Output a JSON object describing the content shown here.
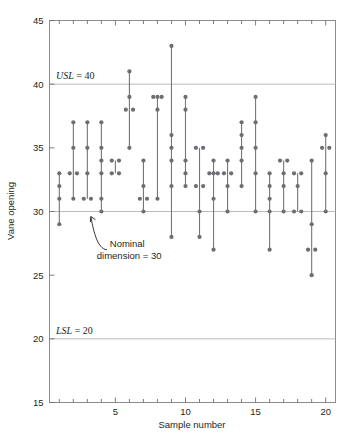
{
  "chart_data": {
    "type": "scatter",
    "title": "",
    "xlabel": "Sample number",
    "ylabel": "Vane opening",
    "xlim": [
      0.3,
      20.7
    ],
    "ylim": [
      15,
      45
    ],
    "ytick_labels": [
      "15",
      "20",
      "25",
      "30",
      "35",
      "40",
      "45"
    ],
    "ytick_values": [
      15,
      20,
      25,
      30,
      35,
      40,
      45
    ],
    "xtick_labels": [
      "5",
      "10",
      "15",
      "20"
    ],
    "xtick_values": [
      5,
      10,
      15,
      20
    ],
    "xminor_values": [
      1,
      2,
      3,
      4,
      6,
      7,
      8,
      9,
      11,
      12,
      13,
      14,
      16,
      17,
      18,
      19
    ],
    "grid": "horizontal-at-spec-and-nominal-only",
    "legend": "none",
    "reference_lines": [
      {
        "name": "USL",
        "label": "USL = 40",
        "value": 40,
        "label_x": 2.0,
        "label_y": 40.8
      },
      {
        "name": "Nominal",
        "label": "Nominal dimension = 30",
        "value": 30
      },
      {
        "name": "LSL",
        "label": "LSL = 20",
        "value": 20,
        "label_x": 2.0,
        "label_y": 20.8
      }
    ],
    "annotation": {
      "text_line1": "Nominal",
      "text_line2": "dimension = 30",
      "text_x": 4.6,
      "text_y": 27.2,
      "arrow_from_x": 4.4,
      "arrow_from_y": 27.0,
      "arrow_to_x": 3.25,
      "arrow_to_y": 29.6
    },
    "series_name": "Vane opening measurements",
    "samples": [
      {
        "sample": 1,
        "values": [
          33,
          32,
          31,
          29
        ]
      },
      {
        "sample": 2,
        "values": [
          33,
          33,
          31,
          35,
          37
        ]
      },
      {
        "sample": 3,
        "values": [
          35,
          37,
          31,
          31,
          33
        ]
      },
      {
        "sample": 4,
        "values": [
          30,
          31,
          33,
          34,
          35,
          37
        ]
      },
      {
        "sample": 5,
        "values": [
          33,
          34,
          34,
          33
        ]
      },
      {
        "sample": 6,
        "values": [
          38,
          41,
          39,
          38,
          35
        ]
      },
      {
        "sample": 7,
        "values": [
          30,
          31,
          32,
          34,
          31
        ]
      },
      {
        "sample": 8,
        "values": [
          39,
          39,
          39,
          38,
          31
        ]
      },
      {
        "sample": 9,
        "values": [
          43,
          36,
          35,
          34,
          32,
          28
        ]
      },
      {
        "sample": 10,
        "values": [
          39,
          38,
          34,
          33,
          32
        ]
      },
      {
        "sample": 11,
        "values": [
          35,
          35,
          32,
          32,
          30,
          28
        ]
      },
      {
        "sample": 12,
        "values": [
          33,
          33,
          33,
          34,
          31,
          27
        ]
      },
      {
        "sample": 13,
        "values": [
          34,
          33,
          33,
          32,
          30
        ]
      },
      {
        "sample": 14,
        "values": [
          37,
          36,
          35,
          34,
          32
        ]
      },
      {
        "sample": 15,
        "values": [
          39,
          37,
          35,
          33,
          30
        ]
      },
      {
        "sample": 16,
        "values": [
          33,
          32,
          31,
          30,
          27
        ]
      },
      {
        "sample": 17,
        "values": [
          34,
          34,
          33,
          32,
          30
        ]
      },
      {
        "sample": 18,
        "values": [
          33,
          33,
          32,
          30,
          30
        ]
      },
      {
        "sample": 19,
        "values": [
          34,
          29,
          27,
          27,
          25
        ]
      },
      {
        "sample": 20,
        "values": [
          36,
          35,
          35,
          33,
          30
        ]
      }
    ]
  }
}
